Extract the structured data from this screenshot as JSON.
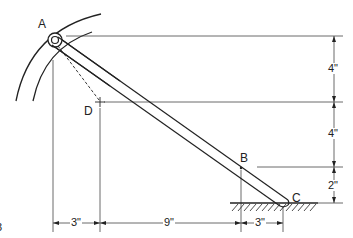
{
  "diagram": {
    "type": "mechanism-geometry",
    "points": {
      "A": "A",
      "B": "B",
      "C": "C",
      "D": "D"
    },
    "vertical_dimensions": {
      "top": "4\"",
      "middle": "4\"",
      "bottom": "2\""
    },
    "horizontal_dimensions": {
      "left": "3\"",
      "middle": "9\"",
      "right": "3\""
    },
    "edge_fragment": "3"
  }
}
